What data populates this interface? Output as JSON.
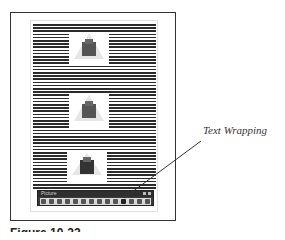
{
  "figure": {
    "caption": "Figure 10-22",
    "callout_label": "Text Wrapping"
  },
  "toolbar": {
    "title": "Picture",
    "buttons": [
      {
        "icon": "insert-picture-icon"
      },
      {
        "icon": "color-icon"
      },
      {
        "icon": "more-contrast-icon"
      },
      {
        "icon": "less-contrast-icon"
      },
      {
        "icon": "more-brightness-icon"
      },
      {
        "icon": "less-brightness-icon"
      },
      {
        "icon": "crop-icon"
      },
      {
        "icon": "rotate-left-icon"
      },
      {
        "icon": "line-style-icon"
      },
      {
        "icon": "compress-pictures-icon"
      },
      {
        "icon": "text-wrapping-icon"
      },
      {
        "icon": "format-picture-icon"
      },
      {
        "icon": "set-transparent-color-icon"
      },
      {
        "icon": "reset-picture-icon"
      }
    ]
  },
  "colors": {
    "frame_border": "#333333",
    "toolbar_bg": "#3b3b3b",
    "toolbar_row": "#d9d9d9",
    "text": "#2a2a2a"
  }
}
